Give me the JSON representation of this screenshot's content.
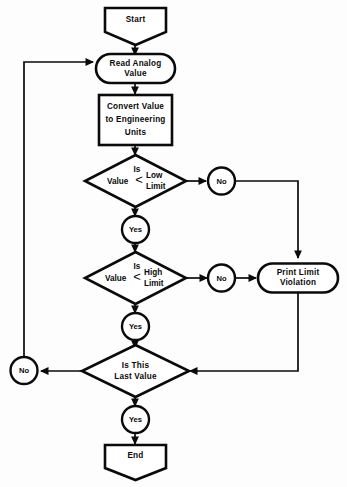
{
  "diagram": {
    "type": "flowchart",
    "orientation": "top-to-bottom",
    "colors": {
      "stroke": "#0a0a0a",
      "fill": "#ffffff",
      "background": "#fdfdfd"
    }
  },
  "nodes": {
    "start": {
      "shape": "pentagon-down",
      "label": "Start"
    },
    "read_analog": {
      "shape": "stadium",
      "line1": "Read Analog",
      "line2": "Value"
    },
    "convert": {
      "shape": "rectangle",
      "line1": "Convert Value",
      "line2": "to Engineering",
      "line3": "Units"
    },
    "decision_low": {
      "shape": "diamond",
      "line1": "Is",
      "operand": "Value",
      "operator": "<",
      "limit1": "Low",
      "limit2": "Limit"
    },
    "decision_high": {
      "shape": "diamond",
      "line1": "Is",
      "operand": "Value",
      "operator": "<",
      "limit1": "High",
      "limit2": "Limit"
    },
    "print_violation": {
      "shape": "stadium",
      "line1": "Print Limit",
      "line2": "Violation"
    },
    "decision_last": {
      "shape": "diamond",
      "line1": "Is This",
      "line2": "Last Value"
    },
    "end": {
      "shape": "pentagon-down",
      "label": "End"
    }
  },
  "connectors": {
    "no_low": "No",
    "yes_low": "Yes",
    "no_high": "No",
    "yes_high": "Yes",
    "no_last": "No",
    "yes_last": "Yes"
  }
}
